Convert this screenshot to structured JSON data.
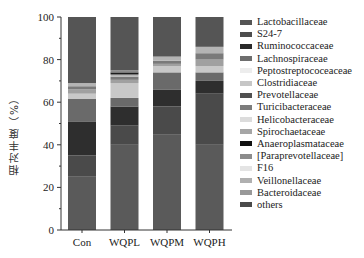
{
  "chart_data": {
    "type": "bar",
    "stacked": true,
    "title": "",
    "xlabel": "",
    "ylabel": "相对丰度（%）",
    "ylim": [
      0,
      100
    ],
    "yticks": [
      0,
      20,
      40,
      60,
      80,
      100
    ],
    "categories": [
      "Con",
      "WQPL",
      "WQPM",
      "WQPH"
    ],
    "legend_position": "right",
    "grid": false,
    "series": [
      {
        "name": "others",
        "color": "#5a5a5a",
        "values": [
          25.0,
          40.0,
          45.0,
          40.0
        ]
      },
      {
        "name": "Bacteroidaceae",
        "color": "#4a4a4a",
        "values": [
          10.0,
          9.0,
          13.0,
          24.0
        ]
      },
      {
        "name": "Veillonellaceae",
        "color": "#2e2e2e",
        "values": [
          16.0,
          9.0,
          8.0,
          6.0
        ]
      },
      {
        "name": "F16",
        "color": "#6a6a6a",
        "values": [
          10.5,
          4.0,
          8.0,
          4.0
        ]
      },
      {
        "name": "[Paraprevotellaceae]",
        "color": "#c8c8c8",
        "values": [
          2.5,
          7.0,
          3.0,
          3.0
        ]
      },
      {
        "name": "Anaeroplasmataceae",
        "color": "#a0a0a0",
        "values": [
          2.0,
          1.5,
          1.0,
          3.0
        ]
      },
      {
        "name": "Spirochaetaceae",
        "color": "#7a7a7a",
        "values": [
          1.5,
          1.5,
          1.5,
          3.0
        ]
      },
      {
        "name": "Helicobacteraceae",
        "color": "#b4b4b4",
        "values": [
          1.5,
          1.0,
          1.5,
          3.0
        ]
      },
      {
        "name": "Turicibacteraceae",
        "color": "#1c1c1c",
        "values": [
          0.0,
          1.0,
          0.0,
          0.0
        ]
      },
      {
        "name": "Prevotellaceae",
        "color": "#8a8a8a",
        "values": [
          0.0,
          1.0,
          0.5,
          0.0
        ]
      },
      {
        "name": "Lactobacillaceae",
        "color": "#555555",
        "values": [
          31.0,
          25.0,
          18.5,
          14.0
        ]
      }
    ]
  },
  "legend": {
    "items": [
      {
        "label": "Lactobacillaceae",
        "color": "#555555"
      },
      {
        "label": "S24-7",
        "color": "#4d4d4d"
      },
      {
        "label": "Ruminococcaceae",
        "color": "#2a2a2a"
      },
      {
        "label": "Lachnospiraceae",
        "color": "#6e6e6e"
      },
      {
        "label": "Peptostreptococeaceae",
        "color": "#ededed"
      },
      {
        "label": "Clostridiaceae",
        "color": "#c6c6c6"
      },
      {
        "label": "Prevotellaceae",
        "color": "#505050"
      },
      {
        "label": "Turicibacteraceae",
        "color": "#7c7c7c"
      },
      {
        "label": "Helicobacteraceae",
        "color": "#dcdcdc"
      },
      {
        "label": "Spirochaetaceae",
        "color": "#a6a6a6"
      },
      {
        "label": "Anaeroplasmataceae",
        "color": "#111111"
      },
      {
        "label": "[Paraprevotellaceae]",
        "color": "#8c8c8c"
      },
      {
        "label": "F16",
        "color": "#e4e4e4"
      },
      {
        "label": "Veillonellaceae",
        "color": "#b0b0b0"
      },
      {
        "label": "Bacteroidaceae",
        "color": "#999999"
      },
      {
        "label": "others",
        "color": "#4a4a4a"
      }
    ]
  },
  "axis": {
    "ylabel": "相对丰度（%）",
    "yticks": [
      "0",
      "20",
      "40",
      "60",
      "80",
      "100"
    ],
    "xticks": [
      "Con",
      "WQPL",
      "WQPM",
      "WQPH"
    ]
  }
}
